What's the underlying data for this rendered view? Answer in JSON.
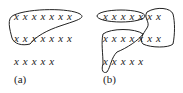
{
  "panels": [
    {
      "label": "(a)",
      "rows": [
        "x x x x x x x",
        "x x x x x x x",
        "x x x x x"
      ]
    },
    {
      "label": "(b)",
      "rows": [
        "x x x x x x x",
        "x x x x x x x",
        "x x x x x"
      ]
    }
  ]
}
